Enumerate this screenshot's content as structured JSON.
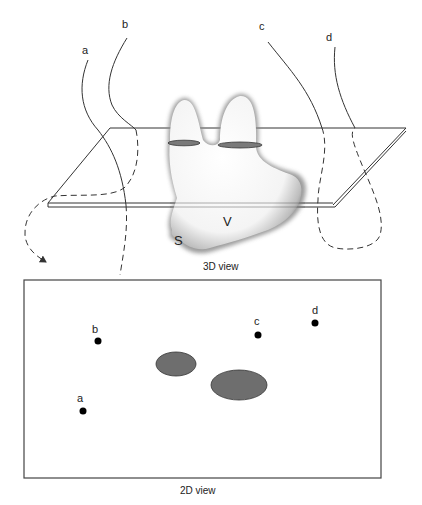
{
  "view3d": {
    "caption": "3D view",
    "curve_labels": [
      "a",
      "b",
      "c",
      "d"
    ],
    "shape_labels": {
      "s": "S",
      "v": "V"
    }
  },
  "view2d": {
    "caption": "2D view",
    "points": [
      {
        "label": "a",
        "x": 83,
        "y": 411
      },
      {
        "label": "b",
        "x": 98,
        "y": 341
      },
      {
        "label": "c",
        "x": 258,
        "y": 335
      },
      {
        "label": "d",
        "x": 315,
        "y": 323
      }
    ],
    "regions": [
      {
        "name": "left-cross-section",
        "cx": 176,
        "cy": 364,
        "rx": 20,
        "ry": 12
      },
      {
        "name": "right-cross-section",
        "cx": 239,
        "cy": 385,
        "rx": 28,
        "ry": 15
      }
    ]
  },
  "colors": {
    "line": "#333333",
    "region_fill": "#6e6e6e",
    "region_stroke": "#333333",
    "point": "#000000"
  }
}
